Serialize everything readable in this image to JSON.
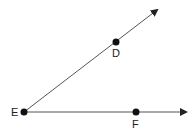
{
  "diagram": {
    "type": "angle",
    "colors": {
      "line": "#555555",
      "point": "#111111",
      "label": "#222222",
      "background": "#ffffff"
    },
    "points": [
      {
        "id": "E",
        "label": "E",
        "x": 24,
        "y": 112,
        "role": "vertex"
      },
      {
        "id": "D",
        "label": "D",
        "x": 116,
        "y": 42
      },
      {
        "id": "F",
        "label": "F",
        "x": 136,
        "y": 112
      }
    ],
    "rays": [
      {
        "id": "ray-ED",
        "from": "E",
        "through": "D",
        "end": {
          "x": 157,
          "y": 10
        }
      },
      {
        "id": "ray-EF",
        "from": "E",
        "through": "F",
        "end": {
          "x": 186,
          "y": 112
        }
      }
    ],
    "labels": {
      "E": "E",
      "D": "D",
      "F": "F"
    }
  }
}
